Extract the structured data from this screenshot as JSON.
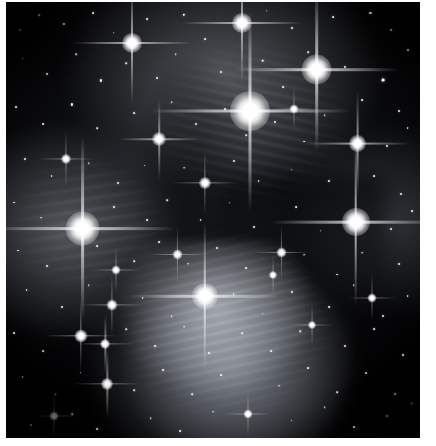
{
  "image": {
    "subject": "Pleiades open star cluster (M45)",
    "kind": "astronomical-photograph",
    "palette": "grayscale",
    "background_color": "#010102",
    "nebula_color": "#d6dbe2",
    "star_color": "#ffffff",
    "border_color": "#ffffff",
    "canvas": {
      "width": 436,
      "height": 446
    },
    "plate": {
      "x": 6,
      "y": 2,
      "width": 414,
      "height": 436
    }
  },
  "bright_stars": [
    {
      "name": "alcyone",
      "x": 59.0,
      "y": 25.0,
      "core": 40,
      "spike": 200,
      "thick": 3.0,
      "mag": 1.0
    },
    {
      "name": "atlas",
      "x": 75.0,
      "y": 15.5,
      "core": 30,
      "spike": 165,
      "thick": 2.6,
      "mag": 0.92
    },
    {
      "name": "electra",
      "x": 18.5,
      "y": 52.0,
      "core": 34,
      "spike": 185,
      "thick": 2.8,
      "mag": 0.95
    },
    {
      "name": "merope",
      "x": 48.0,
      "y": 67.5,
      "core": 26,
      "spike": 150,
      "thick": 2.4,
      "mag": 0.88
    },
    {
      "name": "maia",
      "x": 84.5,
      "y": 50.5,
      "core": 28,
      "spike": 170,
      "thick": 2.6,
      "mag": 0.9
    },
    {
      "name": "taygeta",
      "x": 30.5,
      "y": 9.5,
      "core": 20,
      "spike": 120,
      "thick": 2.0,
      "mag": 0.8
    },
    {
      "name": "pleione",
      "x": 57.0,
      "y": 4.8,
      "core": 20,
      "spike": 120,
      "thick": 2.0,
      "mag": 0.8
    },
    {
      "name": "asterope",
      "x": 85.0,
      "y": 32.5,
      "core": 17,
      "spike": 105,
      "thick": 1.8,
      "mag": 0.74
    },
    {
      "name": "celaeno",
      "x": 37.0,
      "y": 31.5,
      "core": 14,
      "spike": 80,
      "thick": 1.5,
      "mag": 0.68
    },
    {
      "name": "sterope-ii",
      "x": 18.0,
      "y": 76.5,
      "core": 13,
      "spike": 74,
      "thick": 1.4,
      "mag": 0.66
    },
    {
      "name": "hd23512",
      "x": 24.5,
      "y": 87.5,
      "core": 12,
      "spike": 68,
      "thick": 1.3,
      "mag": 0.64
    },
    {
      "name": "hd23608",
      "x": 25.5,
      "y": 69.5,
      "core": 11,
      "spike": 62,
      "thick": 1.2,
      "mag": 0.62
    },
    {
      "name": "hd23873",
      "x": 24.0,
      "y": 78.5,
      "core": 10,
      "spike": 58,
      "thick": 1.2,
      "mag": 0.6
    },
    {
      "name": "hd23629",
      "x": 48.0,
      "y": 41.5,
      "core": 12,
      "spike": 66,
      "thick": 1.3,
      "mag": 0.64
    },
    {
      "name": "hd23753",
      "x": 66.5,
      "y": 57.5,
      "core": 10,
      "spike": 55,
      "thick": 1.1,
      "mag": 0.58
    },
    {
      "name": "hd23924",
      "x": 41.5,
      "y": 58.0,
      "core": 10,
      "spike": 55,
      "thick": 1.1,
      "mag": 0.58
    },
    {
      "name": "hd23632",
      "x": 14.5,
      "y": 36.0,
      "core": 10,
      "spike": 56,
      "thick": 1.1,
      "mag": 0.58
    },
    {
      "name": "hd23441",
      "x": 26.5,
      "y": 61.5,
      "core": 9,
      "spike": 48,
      "thick": 1.0,
      "mag": 0.56
    },
    {
      "name": "hd23325",
      "x": 88.5,
      "y": 68.0,
      "core": 9,
      "spike": 48,
      "thick": 1.0,
      "mag": 0.56
    },
    {
      "name": "hd23247",
      "x": 69.5,
      "y": 24.5,
      "core": 9,
      "spike": 46,
      "thick": 1.0,
      "mag": 0.55
    },
    {
      "name": "hd23410",
      "x": 74.0,
      "y": 74.0,
      "core": 8,
      "spike": 42,
      "thick": 0.9,
      "mag": 0.54
    },
    {
      "name": "hd23061",
      "x": 11.5,
      "y": 95.0,
      "core": 9,
      "spike": 46,
      "thick": 1.0,
      "mag": 0.55
    },
    {
      "name": "hd22615",
      "x": 58.5,
      "y": 94.5,
      "core": 9,
      "spike": 46,
      "thick": 1.0,
      "mag": 0.55
    },
    {
      "name": "hd23850",
      "x": 64.5,
      "y": 62.5,
      "core": 8,
      "spike": 40,
      "thick": 0.9,
      "mag": 0.52
    }
  ],
  "field_stars": [
    {
      "x": 3.5,
      "y": 6.5,
      "r": 1.0
    },
    {
      "x": 8.0,
      "y": 3.0,
      "r": 0.8
    },
    {
      "x": 14.0,
      "y": 5.0,
      "r": 1.1
    },
    {
      "x": 21.0,
      "y": 2.5,
      "r": 0.9
    },
    {
      "x": 26.0,
      "y": 7.0,
      "r": 0.8
    },
    {
      "x": 34.0,
      "y": 4.0,
      "r": 0.9
    },
    {
      "x": 43.0,
      "y": 3.0,
      "r": 1.2
    },
    {
      "x": 48.0,
      "y": 8.5,
      "r": 0.9
    },
    {
      "x": 63.0,
      "y": 2.0,
      "r": 0.8
    },
    {
      "x": 69.0,
      "y": 6.0,
      "r": 1.0
    },
    {
      "x": 79.0,
      "y": 3.5,
      "r": 0.9
    },
    {
      "x": 88.0,
      "y": 2.5,
      "r": 1.1
    },
    {
      "x": 93.0,
      "y": 6.5,
      "r": 0.9
    },
    {
      "x": 97.0,
      "y": 11.0,
      "r": 1.0
    },
    {
      "x": 91.0,
      "y": 18.0,
      "r": 1.4
    },
    {
      "x": 4.0,
      "y": 13.0,
      "r": 0.9
    },
    {
      "x": 10.0,
      "y": 16.5,
      "r": 1.0
    },
    {
      "x": 17.0,
      "y": 12.0,
      "r": 0.8
    },
    {
      "x": 23.0,
      "y": 18.0,
      "r": 1.1
    },
    {
      "x": 29.0,
      "y": 14.0,
      "r": 0.8
    },
    {
      "x": 36.5,
      "y": 17.5,
      "r": 1.0
    },
    {
      "x": 41.0,
      "y": 12.0,
      "r": 0.8
    },
    {
      "x": 52.0,
      "y": 16.0,
      "r": 1.0
    },
    {
      "x": 62.0,
      "y": 13.5,
      "r": 1.3
    },
    {
      "x": 67.0,
      "y": 19.5,
      "r": 0.9
    },
    {
      "x": 73.0,
      "y": 11.5,
      "r": 0.8
    },
    {
      "x": 82.0,
      "y": 15.0,
      "r": 1.0
    },
    {
      "x": 86.0,
      "y": 22.5,
      "r": 0.9
    },
    {
      "x": 95.0,
      "y": 25.0,
      "r": 1.0
    },
    {
      "x": 2.5,
      "y": 24.0,
      "r": 1.0
    },
    {
      "x": 9.0,
      "y": 28.0,
      "r": 0.9
    },
    {
      "x": 16.0,
      "y": 23.5,
      "r": 1.1
    },
    {
      "x": 22.0,
      "y": 29.0,
      "r": 0.8
    },
    {
      "x": 31.0,
      "y": 25.5,
      "r": 0.9
    },
    {
      "x": 40.0,
      "y": 23.0,
      "r": 0.8
    },
    {
      "x": 46.0,
      "y": 28.0,
      "r": 1.0
    },
    {
      "x": 53.0,
      "y": 24.5,
      "r": 0.9
    },
    {
      "x": 58.0,
      "y": 30.5,
      "r": 0.8
    },
    {
      "x": 65.0,
      "y": 27.5,
      "r": 1.0
    },
    {
      "x": 72.0,
      "y": 32.0,
      "r": 0.9
    },
    {
      "x": 77.0,
      "y": 26.0,
      "r": 0.8
    },
    {
      "x": 92.0,
      "y": 33.0,
      "r": 1.0
    },
    {
      "x": 97.0,
      "y": 29.0,
      "r": 0.9
    },
    {
      "x": 4.5,
      "y": 36.0,
      "r": 1.0
    },
    {
      "x": 11.0,
      "y": 40.0,
      "r": 0.9
    },
    {
      "x": 20.0,
      "y": 37.0,
      "r": 0.8
    },
    {
      "x": 27.0,
      "y": 41.5,
      "r": 1.0
    },
    {
      "x": 33.5,
      "y": 37.5,
      "r": 0.9
    },
    {
      "x": 43.0,
      "y": 38.0,
      "r": 0.8
    },
    {
      "x": 55.0,
      "y": 36.5,
      "r": 1.0
    },
    {
      "x": 61.0,
      "y": 41.0,
      "r": 0.9
    },
    {
      "x": 69.0,
      "y": 38.5,
      "r": 0.8
    },
    {
      "x": 78.0,
      "y": 41.0,
      "r": 1.1
    },
    {
      "x": 89.0,
      "y": 40.0,
      "r": 0.9
    },
    {
      "x": 95.5,
      "y": 44.0,
      "r": 1.0
    },
    {
      "x": 2.0,
      "y": 46.0,
      "r": 0.9
    },
    {
      "x": 8.5,
      "y": 49.5,
      "r": 0.8
    },
    {
      "x": 26.0,
      "y": 47.0,
      "r": 1.0
    },
    {
      "x": 34.0,
      "y": 50.0,
      "r": 0.9
    },
    {
      "x": 39.0,
      "y": 45.5,
      "r": 0.8
    },
    {
      "x": 47.0,
      "y": 50.0,
      "r": 0.9
    },
    {
      "x": 54.0,
      "y": 46.0,
      "r": 0.8
    },
    {
      "x": 60.0,
      "y": 51.5,
      "r": 1.0
    },
    {
      "x": 70.0,
      "y": 47.0,
      "r": 0.9
    },
    {
      "x": 76.0,
      "y": 52.5,
      "r": 0.8
    },
    {
      "x": 93.0,
      "y": 52.0,
      "r": 1.0
    },
    {
      "x": 98.0,
      "y": 48.0,
      "r": 0.9
    },
    {
      "x": 3.0,
      "y": 57.0,
      "r": 0.9
    },
    {
      "x": 10.0,
      "y": 60.5,
      "r": 1.0
    },
    {
      "x": 22.0,
      "y": 56.0,
      "r": 0.9
    },
    {
      "x": 31.0,
      "y": 59.5,
      "r": 0.8
    },
    {
      "x": 37.0,
      "y": 55.0,
      "r": 0.9
    },
    {
      "x": 44.0,
      "y": 60.0,
      "r": 0.8
    },
    {
      "x": 51.0,
      "y": 56.5,
      "r": 1.0
    },
    {
      "x": 58.0,
      "y": 61.0,
      "r": 0.9
    },
    {
      "x": 72.0,
      "y": 58.0,
      "r": 0.8
    },
    {
      "x": 80.0,
      "y": 62.5,
      "r": 0.9
    },
    {
      "x": 86.0,
      "y": 57.5,
      "r": 0.8
    },
    {
      "x": 95.0,
      "y": 60.0,
      "r": 1.0
    },
    {
      "x": 5.0,
      "y": 66.0,
      "r": 0.9
    },
    {
      "x": 13.5,
      "y": 70.0,
      "r": 1.0
    },
    {
      "x": 20.0,
      "y": 65.0,
      "r": 0.8
    },
    {
      "x": 33.0,
      "y": 68.0,
      "r": 0.9
    },
    {
      "x": 40.0,
      "y": 72.0,
      "r": 0.8
    },
    {
      "x": 55.0,
      "y": 67.0,
      "r": 0.9
    },
    {
      "x": 62.0,
      "y": 71.5,
      "r": 0.8
    },
    {
      "x": 69.0,
      "y": 66.5,
      "r": 1.0
    },
    {
      "x": 78.0,
      "y": 70.0,
      "r": 0.9
    },
    {
      "x": 84.0,
      "y": 65.0,
      "r": 0.8
    },
    {
      "x": 91.0,
      "y": 72.0,
      "r": 1.0
    },
    {
      "x": 97.0,
      "y": 67.5,
      "r": 0.9
    },
    {
      "x": 2.0,
      "y": 76.0,
      "r": 1.0
    },
    {
      "x": 9.0,
      "y": 80.0,
      "r": 0.9
    },
    {
      "x": 29.0,
      "y": 75.0,
      "r": 0.8
    },
    {
      "x": 36.0,
      "y": 79.0,
      "r": 0.9
    },
    {
      "x": 43.0,
      "y": 74.5,
      "r": 0.8
    },
    {
      "x": 49.0,
      "y": 80.5,
      "r": 0.9
    },
    {
      "x": 57.0,
      "y": 76.0,
      "r": 0.8
    },
    {
      "x": 64.0,
      "y": 80.0,
      "r": 0.9
    },
    {
      "x": 71.0,
      "y": 75.5,
      "r": 0.8
    },
    {
      "x": 82.0,
      "y": 79.0,
      "r": 1.0
    },
    {
      "x": 89.0,
      "y": 75.0,
      "r": 0.9
    },
    {
      "x": 96.0,
      "y": 81.0,
      "r": 1.0
    },
    {
      "x": 4.0,
      "y": 86.0,
      "r": 0.9
    },
    {
      "x": 12.0,
      "y": 90.0,
      "r": 0.8
    },
    {
      "x": 18.0,
      "y": 85.0,
      "r": 0.9
    },
    {
      "x": 31.0,
      "y": 89.0,
      "r": 0.8
    },
    {
      "x": 38.0,
      "y": 84.5,
      "r": 0.9
    },
    {
      "x": 45.0,
      "y": 90.0,
      "r": 0.8
    },
    {
      "x": 52.0,
      "y": 85.5,
      "r": 0.9
    },
    {
      "x": 66.0,
      "y": 88.0,
      "r": 0.8
    },
    {
      "x": 73.0,
      "y": 84.0,
      "r": 0.9
    },
    {
      "x": 80.0,
      "y": 89.5,
      "r": 0.8
    },
    {
      "x": 87.0,
      "y": 85.0,
      "r": 1.0
    },
    {
      "x": 94.0,
      "y": 90.0,
      "r": 0.9
    },
    {
      "x": 6.0,
      "y": 97.0,
      "r": 0.9
    },
    {
      "x": 16.0,
      "y": 94.5,
      "r": 0.8
    },
    {
      "x": 22.0,
      "y": 98.0,
      "r": 0.9
    },
    {
      "x": 35.0,
      "y": 95.5,
      "r": 0.8
    },
    {
      "x": 42.0,
      "y": 98.5,
      "r": 0.9
    },
    {
      "x": 50.0,
      "y": 94.0,
      "r": 0.8
    },
    {
      "x": 69.0,
      "y": 96.0,
      "r": 0.9
    },
    {
      "x": 77.0,
      "y": 93.0,
      "r": 0.8
    },
    {
      "x": 84.0,
      "y": 97.5,
      "r": 0.9
    },
    {
      "x": 92.0,
      "y": 95.0,
      "r": 1.0
    },
    {
      "x": 98.0,
      "y": 92.0,
      "r": 0.8
    }
  ]
}
